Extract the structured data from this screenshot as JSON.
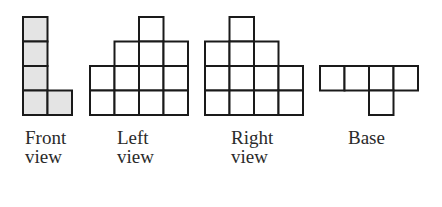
{
  "colors": {
    "stroke": "#1a1a1a",
    "shaded_fill": "#e4e4e4",
    "plain_fill": "#ffffff",
    "text": "#2a2a2a"
  },
  "cell_size": 24.5,
  "views": [
    {
      "id": "front",
      "label_line1": "Front",
      "label_line2": "view",
      "origin": [
        23,
        17
      ],
      "label_pos": [
        25,
        128
      ],
      "shaded": true,
      "cells": [
        [
          0,
          0
        ],
        [
          0,
          1
        ],
        [
          0,
          2
        ],
        [
          0,
          3
        ],
        [
          1,
          3
        ]
      ]
    },
    {
      "id": "left",
      "label_line1": "Left",
      "label_line2": "view",
      "origin": [
        90,
        17
      ],
      "label_pos": [
        117,
        128
      ],
      "shaded": false,
      "cells": [
        [
          2,
          0
        ],
        [
          1,
          1
        ],
        [
          2,
          1
        ],
        [
          3,
          1
        ],
        [
          0,
          2
        ],
        [
          1,
          2
        ],
        [
          2,
          2
        ],
        [
          3,
          2
        ],
        [
          0,
          3
        ],
        [
          1,
          3
        ],
        [
          2,
          3
        ],
        [
          3,
          3
        ]
      ]
    },
    {
      "id": "right",
      "label_line1": "Right",
      "label_line2": "view",
      "origin": [
        205,
        17
      ],
      "label_pos": [
        231,
        128
      ],
      "shaded": false,
      "cells": [
        [
          1,
          0
        ],
        [
          0,
          1
        ],
        [
          1,
          1
        ],
        [
          2,
          1
        ],
        [
          0,
          2
        ],
        [
          1,
          2
        ],
        [
          2,
          2
        ],
        [
          3,
          2
        ],
        [
          0,
          3
        ],
        [
          1,
          3
        ],
        [
          2,
          3
        ],
        [
          3,
          3
        ]
      ]
    },
    {
      "id": "base",
      "label_line1": "Base",
      "label_line2": "",
      "origin": [
        320,
        66
      ],
      "label_pos": [
        348,
        128
      ],
      "shaded": false,
      "cells": [
        [
          0,
          0
        ],
        [
          1,
          0
        ],
        [
          2,
          0
        ],
        [
          3,
          0
        ],
        [
          2,
          1
        ]
      ]
    }
  ]
}
